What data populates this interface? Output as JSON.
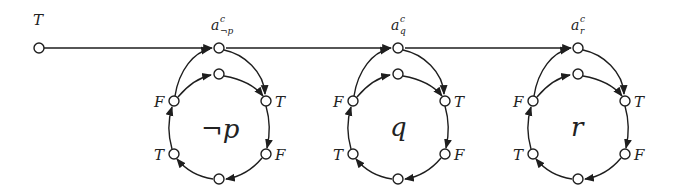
{
  "diagram": {
    "start_node": {
      "label": "T",
      "x": 39,
      "y": 48
    },
    "main_line_color": "#1e1e1e",
    "gadgets": [
      {
        "center_label": "¬p",
        "top_label_base": "a",
        "top_label_sup": "c",
        "top_label_sub": "¬p",
        "cx": 219,
        "labels": {
          "upper_left": "F",
          "upper_right": "T",
          "lower_left": "T",
          "lower_right": "F"
        }
      },
      {
        "center_label": "q",
        "top_label_base": "a",
        "top_label_sup": "c",
        "top_label_sub": "q",
        "cx": 398,
        "labels": {
          "upper_left": "F",
          "upper_right": "T",
          "lower_left": "T",
          "lower_right": "F"
        }
      },
      {
        "center_label": "r",
        "top_label_base": "a",
        "top_label_sup": "c",
        "top_label_sub": "r",
        "cx": 578,
        "labels": {
          "upper_left": "F",
          "upper_right": "T",
          "lower_left": "T",
          "lower_right": "F"
        }
      }
    ]
  }
}
